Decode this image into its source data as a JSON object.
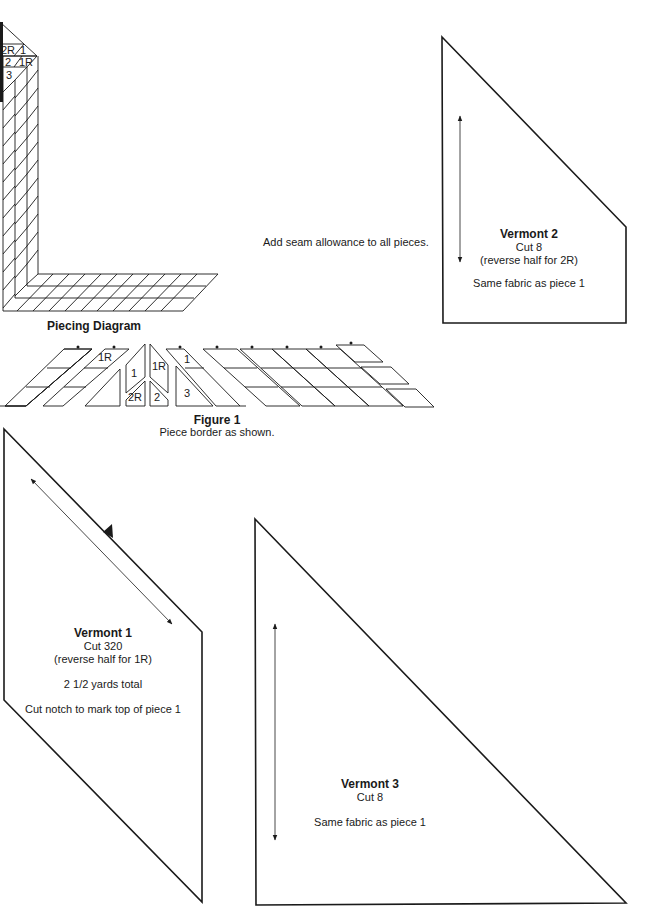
{
  "piecing_diagram": {
    "caption": "Piecing Diagram",
    "labels": [
      "2R",
      "1",
      "2",
      "1R",
      "3"
    ]
  },
  "seam_note": "Add seam allowance to all pieces.",
  "figure1": {
    "title": "Figure 1",
    "subtitle": "Piece border as shown.",
    "labels": {
      "p1R_a": "1R",
      "p1": "1",
      "p1R_b": "1R",
      "p2R": "2R",
      "p2": "2",
      "p1_c": "1",
      "p3": "3"
    }
  },
  "vermont2": {
    "title": "Vermont 2",
    "cut": "Cut 8",
    "note": "(reverse half for 2R)",
    "fabric": "Same fabric as piece 1"
  },
  "vermont1": {
    "title": "Vermont 1",
    "cut": "Cut 320",
    "note": "(reverse half for 1R)",
    "yardage": "2 1/2 yards total",
    "notch_note": "Cut notch to mark top of piece 1"
  },
  "vermont3": {
    "title": "Vermont 3",
    "cut": "Cut 8",
    "fabric": "Same fabric as piece 1"
  },
  "colors": {
    "line": "#1a1a1a",
    "background": "#ffffff"
  }
}
